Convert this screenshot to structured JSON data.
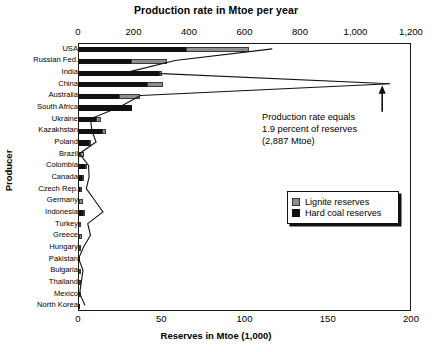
{
  "chart_data": {
    "type": "bar",
    "title": "Production rate in Mtoe per year",
    "xlabel": "Reserves in Mtoe (1,000)",
    "ylabel": "Producer",
    "top_axis": {
      "label": "Production rate in Mtoe per year",
      "ticks": [
        "0",
        "200",
        "400",
        "600",
        "800",
        "1,000",
        "1,200"
      ],
      "tick_values": [
        0,
        200,
        400,
        600,
        800,
        1000,
        1200
      ],
      "range": [
        0,
        1200
      ]
    },
    "bottom_axis": {
      "label": "Reserves in Mtoe (1,000)",
      "ticks": [
        "0",
        "50",
        "100",
        "150",
        "200"
      ],
      "tick_values": [
        0,
        50,
        100,
        150,
        200
      ],
      "range": [
        0,
        200
      ]
    },
    "grid": false,
    "legend_position": "inside-right",
    "legend": [
      {
        "key": "lignite",
        "label": "Lignite reserves",
        "color": "#8e8e8e"
      },
      {
        "key": "hard_coal",
        "label": "Hard coal reserves",
        "color": "#111111"
      }
    ],
    "categories": [
      "USA",
      "Russian Fed.",
      "India",
      "China",
      "Australia",
      "South Africa",
      "Ukraine",
      "Kazakhstan",
      "Poland",
      "Brazil",
      "Colombia",
      "Canada",
      "Czech Rep.",
      "Germany",
      "Indonesia",
      "Turkey",
      "Greece",
      "Hungary",
      "Pakistan",
      "Bulgaria",
      "Thailand",
      "Mexico",
      "North Korea"
    ],
    "series": [
      {
        "name": "Hard coal reserves",
        "unit": "Mtoe (1,000)",
        "values": [
          64.0,
          31.0,
          48.0,
          41.0,
          24.0,
          32.0,
          10.5,
          14.0,
          6.0,
          0.0,
          3.5,
          1.8,
          0.6,
          0.1,
          2.4,
          0.3,
          0.0,
          0.0,
          0.2,
          0.0,
          0.0,
          0.1,
          0.3
        ]
      },
      {
        "name": "Lignite reserves",
        "unit": "Mtoe (1,000)",
        "values": [
          38.0,
          22.0,
          2.0,
          9.5,
          12.5,
          0.0,
          3.0,
          2.0,
          1.5,
          3.0,
          0.2,
          1.2,
          1.4,
          2.5,
          0.6,
          1.0,
          1.8,
          1.0,
          0.0,
          0.9,
          0.6,
          0.3,
          0.0
        ]
      },
      {
        "name": "Production rate",
        "unit": "Mtoe per year",
        "values": [
          700,
          350,
          180,
          1125,
          225,
          150,
          45,
          50,
          65,
          5,
          38,
          40,
          30,
          60,
          90,
          35,
          45,
          20,
          2,
          18,
          12,
          6,
          25
        ]
      }
    ],
    "annotation": {
      "lines": [
        "Production rate equals",
        "1.9 percent of reserves",
        "(2,887 Mtoe)"
      ],
      "text": "Production rate equals 1.9 percent of reserves (2,887 Mtoe)",
      "points_to": "China production rate"
    }
  },
  "colors": {
    "lignite": "#8e8e8e",
    "hard_coal": "#111111",
    "axis": "#1a1a1a",
    "background": "#ffffff"
  }
}
